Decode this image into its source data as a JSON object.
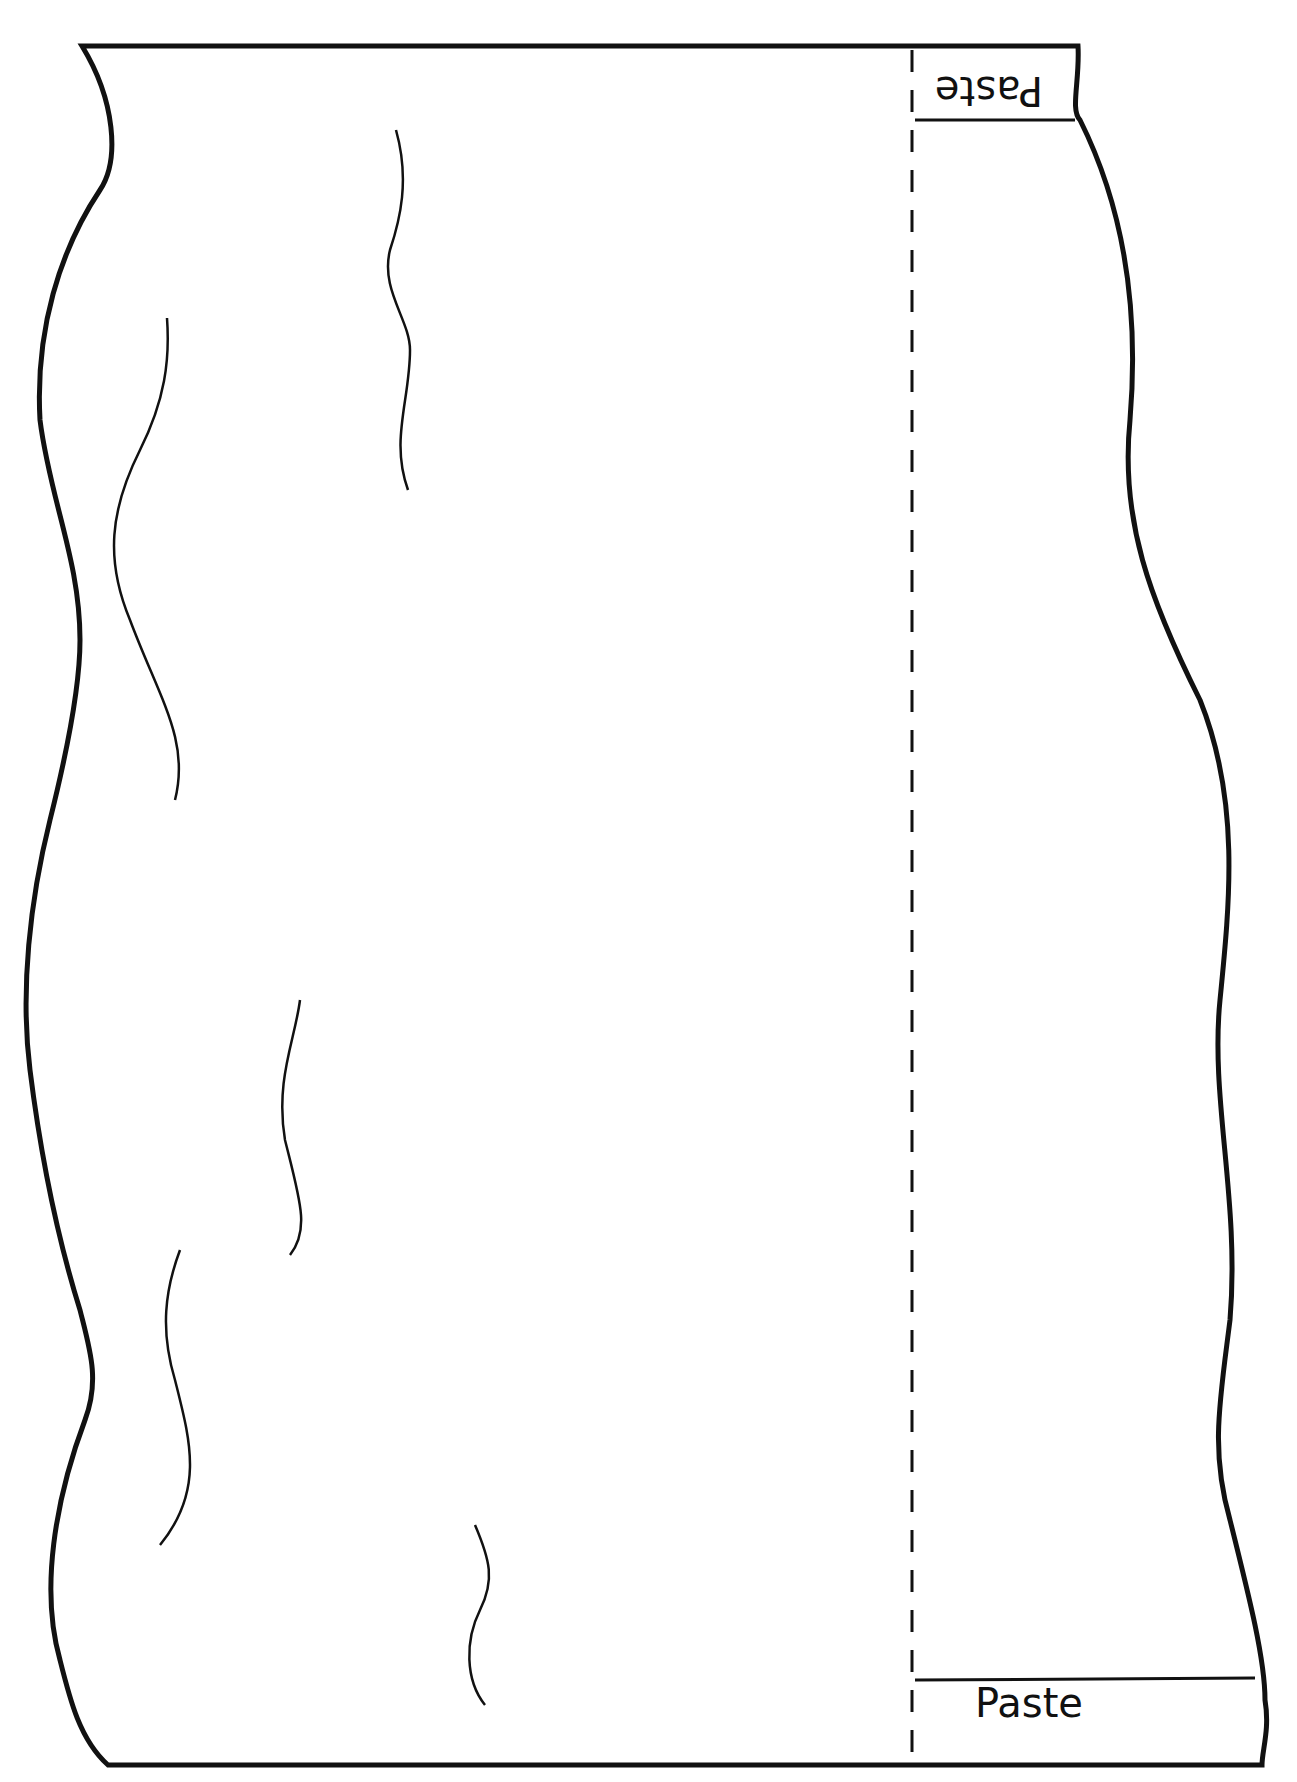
{
  "template": {
    "description": "Wavy-edged paper craft template with fold line and paste tabs",
    "stroke_color": "#111111",
    "background_color": "#ffffff"
  },
  "tabs": {
    "top": {
      "label": "Paste",
      "orientation": "upside-down"
    },
    "bottom": {
      "label": "Paste",
      "orientation": "upright"
    }
  },
  "fold_line": {
    "style": "dashed",
    "x": 912
  }
}
